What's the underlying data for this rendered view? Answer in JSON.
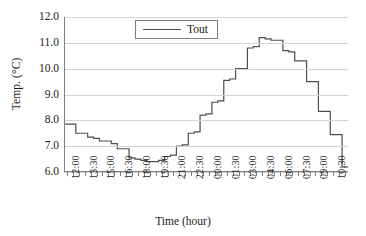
{
  "chart_data": {
    "type": "line",
    "title": "",
    "xlabel": "Time (hour)",
    "ylabel": "Temp. (°C)",
    "ylim": [
      6.0,
      12.0
    ],
    "ytick_labels": [
      "12.0",
      "11.0",
      "10.0",
      "9.0",
      "8.0",
      "7.0",
      "6.0"
    ],
    "ytick_values": [
      12.0,
      11.0,
      10.0,
      9.0,
      8.0,
      7.0,
      6.0
    ],
    "xtick_labels": [
      "12:00",
      "13:30",
      "15:00",
      "16:30",
      "18:00",
      "19:30",
      "21:00",
      "22:30",
      "00:00",
      "01:30",
      "03:00",
      "04:30",
      "06:00",
      "07:30",
      "09:00",
      "10:30"
    ],
    "grid": "horizontal",
    "legend_position": "top-center",
    "line_color": "#4d4d4d",
    "grid_color": "#d4d4d4",
    "axis_color": "#808080",
    "step_style": "post",
    "x_interval_minutes": 30,
    "x_start": "12:00",
    "series": [
      {
        "name": "Tout",
        "x": [
          "12:00",
          "12:30",
          "13:00",
          "13:30",
          "14:00",
          "14:30",
          "15:00",
          "15:30",
          "16:00",
          "16:30",
          "17:00",
          "17:30",
          "18:00",
          "18:30",
          "19:00",
          "19:30",
          "20:00",
          "20:30",
          "21:00",
          "21:30",
          "22:00",
          "22:30",
          "23:00",
          "23:30",
          "00:00",
          "00:30",
          "01:00",
          "01:30",
          "02:00",
          "02:30",
          "03:00",
          "03:30",
          "04:00",
          "04:30",
          "05:00",
          "05:30",
          "06:00",
          "06:30",
          "07:00",
          "07:30",
          "08:00",
          "08:30",
          "09:00",
          "09:30",
          "10:00",
          "10:30",
          "11:00",
          "11:30"
        ],
        "values": [
          7.85,
          7.85,
          7.5,
          7.5,
          7.35,
          7.3,
          7.2,
          7.2,
          7.1,
          6.9,
          6.9,
          6.55,
          6.5,
          6.45,
          6.4,
          6.4,
          6.45,
          6.6,
          6.65,
          7.0,
          7.05,
          7.5,
          7.55,
          8.2,
          8.25,
          8.7,
          8.75,
          9.55,
          9.6,
          10.0,
          10.0,
          10.8,
          10.85,
          11.2,
          11.15,
          11.1,
          11.1,
          10.7,
          10.65,
          10.3,
          10.3,
          9.5,
          9.5,
          8.35,
          8.35,
          7.45,
          7.45,
          6.2
        ]
      }
    ]
  },
  "legend": {
    "entries": [
      {
        "label": "Tout"
      }
    ]
  },
  "axes": {
    "x_title": "Time (hour)",
    "y_title": "Temp. (°C)"
  }
}
